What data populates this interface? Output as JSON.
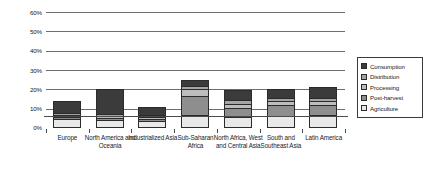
{
  "chart_data": {
    "type": "bar",
    "subtype": "stacked-column",
    "title": "",
    "xlabel": "",
    "ylabel": "",
    "ylim": [
      0,
      60
    ],
    "y_tick_labels": [
      "0%",
      "10%",
      "20%",
      "30%",
      "40%",
      "50%",
      "60%"
    ],
    "y_tick_values": [
      0,
      10,
      20,
      30,
      40,
      50,
      60
    ],
    "grid": true,
    "grid_axis": "y",
    "legend_position": "right",
    "categories": [
      "Europe",
      "North America and Oceania",
      "Industrialized Asia",
      "Sub-Saharan Africa",
      "North Africa, West and Central Asia",
      "South and Southeast Asia",
      "Latin America"
    ],
    "series": [
      {
        "name": "Agriculture",
        "color": "#e9e9e9",
        "values": [
          4.0,
          3.5,
          3.0,
          6.0,
          5.0,
          5.5,
          6.0
        ]
      },
      {
        "name": "Post-harvest",
        "color": "#8e8e8e",
        "values": [
          1.0,
          1.0,
          1.0,
          10.0,
          5.0,
          6.0,
          5.5
        ]
      },
      {
        "name": "Processing",
        "color": "#bdbdbd",
        "values": [
          1.0,
          1.0,
          1.0,
          4.0,
          2.0,
          2.0,
          2.0
        ]
      },
      {
        "name": "Distribution",
        "color": "#a5a5a5",
        "values": [
          1.0,
          1.0,
          1.0,
          1.5,
          2.0,
          2.0,
          2.0
        ]
      },
      {
        "name": "Consumption",
        "color": "#3b3b3b",
        "values": [
          7.0,
          13.5,
          5.0,
          3.5,
          5.5,
          4.5,
          5.5
        ]
      }
    ],
    "totals": [
      14.0,
      20.0,
      11.0,
      25.0,
      19.5,
      20.0,
      21.0
    ]
  },
  "legend": {
    "items": [
      {
        "label": "Consumption",
        "swatch": "#3b3b3b"
      },
      {
        "label": "Distribution",
        "swatch": "#a5a5a5"
      },
      {
        "label": "Processing",
        "swatch": "#bdbdbd"
      },
      {
        "label": "Post-harvest",
        "swatch": "#8e8e8e"
      },
      {
        "label": "Agriculture",
        "swatch": "#e9e9e9"
      }
    ]
  }
}
